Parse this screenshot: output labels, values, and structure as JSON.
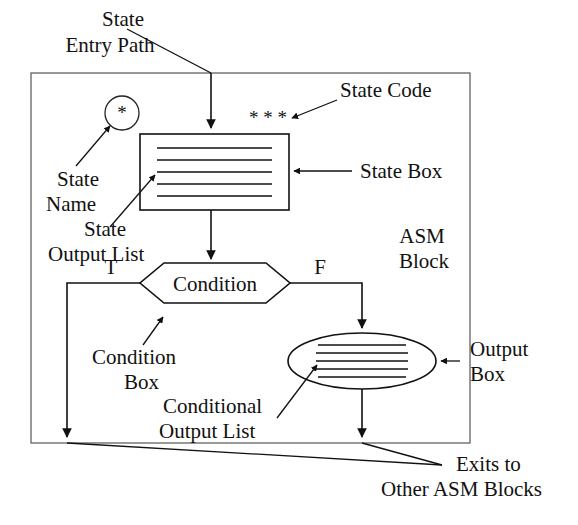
{
  "figure": {
    "background_color": "#ffffff",
    "line_color": "#111111",
    "outer_border_color": "#555555"
  },
  "labels": {
    "state_entry_path_line1": "State",
    "state_entry_path_line2": "Entry Path",
    "state_code": "State Code",
    "state_box": "State Box",
    "state_name_line1": "State",
    "state_name_line2": "Name",
    "state_output_list_line1": "State",
    "state_output_list_line2": "Output List",
    "asm_block_line1": "ASM",
    "asm_block_line2": "Block",
    "condition": "Condition",
    "branch_true": "T",
    "branch_false": "F",
    "condition_box_line1": "Condition",
    "condition_box_line2": "Box",
    "conditional_output_list_line1": "Conditional",
    "conditional_output_list_line2": "Output List",
    "output_box_line1": "Output",
    "output_box_line2": "Box",
    "exits_line1": "Exits to",
    "exits_line2": "Other ASM Blocks",
    "state_code_marker": "* * *",
    "state_name_marker": "*"
  },
  "shapes": {
    "asm_block_border": {
      "x": 31,
      "y": 73,
      "width": 439,
      "height": 370
    },
    "state_box": {
      "x": 140,
      "y": 134,
      "width": 149,
      "height": 76,
      "list_lines": 5
    },
    "state_name_circle": {
      "cx": 122,
      "cy": 113,
      "r": 17
    },
    "condition_hexagon": {
      "x": 140,
      "y": 263,
      "width": 150,
      "height": 40
    },
    "output_ellipse": {
      "cx": 362,
      "cy": 361,
      "rx": 74,
      "ry": 28,
      "list_lines": 5
    },
    "exits_convergence_point": {
      "x": 442,
      "y": 465
    }
  }
}
